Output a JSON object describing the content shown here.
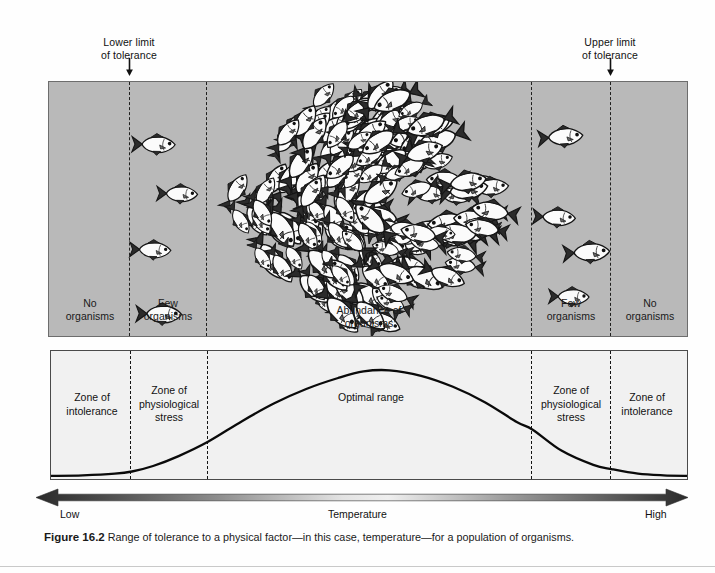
{
  "figure": {
    "number_label": "Figure 16.2",
    "caption_text": " Range of tolerance to a physical factor—in this case, temperature—for a population of organisms."
  },
  "annotations": {
    "lower_limit": "Lower limit\nof tolerance",
    "upper_limit": "Upper limit\nof tolerance"
  },
  "fish_panel": {
    "zones": [
      {
        "label": "No\norganisms"
      },
      {
        "label": "Few\norganisms"
      },
      {
        "label": "Abundance of\norganisms"
      },
      {
        "label": "Few\norganisms"
      },
      {
        "label": "No\norganisms"
      }
    ],
    "background_color": "#b9b9b9"
  },
  "curve_panel": {
    "y_axis_label": "Population size",
    "zones": [
      {
        "label": "Zone of\nintolerance"
      },
      {
        "label": "Zone of\nphysiological\nstress"
      },
      {
        "label": "Optimal range"
      },
      {
        "label": "Zone of\nphysiological\nstress"
      },
      {
        "label": "Zone of\nintolerance"
      }
    ],
    "background_color": "#f1f1f1"
  },
  "temperature_axis": {
    "title": "Temperature",
    "low_label": "Low",
    "high_label": "High"
  },
  "chart_data": {
    "type": "line",
    "xlabel": "Temperature",
    "ylabel": "Population size",
    "grid": false,
    "legend": null,
    "xlim": [
      0,
      100
    ],
    "ylim": [
      0,
      100
    ],
    "x_tick_labels": [
      "Low",
      "High"
    ],
    "annotations": [
      {
        "text": "Lower limit of tolerance",
        "x": 12.7
      },
      {
        "text": "Upper limit of tolerance",
        "x": 88.0
      }
    ],
    "zone_boundaries_pct": [
      12.7,
      24.6,
      75.5,
      88.0
    ],
    "zones": [
      {
        "name": "Zone of intolerance",
        "x_range": [
          0,
          12.7
        ],
        "organisms": "No organisms"
      },
      {
        "name": "Zone of physiological stress",
        "x_range": [
          12.7,
          24.6
        ],
        "organisms": "Few organisms"
      },
      {
        "name": "Optimal range",
        "x_range": [
          24.6,
          75.5
        ],
        "organisms": "Abundance of organisms"
      },
      {
        "name": "Zone of physiological stress",
        "x_range": [
          75.5,
          88.0
        ],
        "organisms": "Few organisms"
      },
      {
        "name": "Zone of intolerance",
        "x_range": [
          88.0,
          100
        ],
        "organisms": "No organisms"
      }
    ],
    "series": [
      {
        "name": "Population size",
        "x": [
          0,
          5,
          10,
          12.7,
          16,
          20,
          24.6,
          30,
          35,
          40,
          45,
          49,
          53,
          58,
          63,
          68,
          73,
          75.5,
          80,
          85,
          88,
          92,
          96,
          100
        ],
        "values": [
          1,
          1.5,
          3,
          5,
          10,
          19,
          32,
          51,
          67,
          80,
          90,
          96,
          97,
          92,
          82,
          68,
          50,
          43,
          24,
          11,
          7,
          3,
          1.5,
          1
        ]
      }
    ]
  }
}
